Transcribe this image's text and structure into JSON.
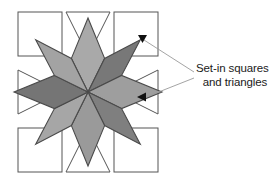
{
  "figure": {
    "title": "Set-in squares and triangles",
    "background_color": "#ffffff",
    "width": 275,
    "height": 185
  },
  "callout": {
    "line1": "Set-in squares",
    "line2": "and triangles",
    "text_color": "#1a1a1a",
    "leader_color": "#9a9a9a",
    "arrow_color": "#111111",
    "arrow_targets": [
      "top-right-set-in-square",
      "right-set-in-triangle"
    ]
  },
  "block": {
    "name": "eight-point-star-quilt-block",
    "outline_color": "#444444",
    "center": {
      "x": 88,
      "y": 92
    },
    "star": {
      "type": "lemoyne-eight-point-star",
      "point_count": 8,
      "outer_radius": 74,
      "half_width": 30.6,
      "edge_color": "#4a4a4a",
      "edge_width": 1.1,
      "diamonds": [
        {
          "name": "star-diamond-n",
          "direction": "north",
          "angle_deg": -90,
          "fill": "#a9a9a9"
        },
        {
          "name": "star-diamond-ne",
          "direction": "northeast",
          "angle_deg": -45,
          "fill": "#787878"
        },
        {
          "name": "star-diamond-e",
          "direction": "east",
          "angle_deg": 0,
          "fill": "#9e9e9e"
        },
        {
          "name": "star-diamond-se",
          "direction": "southeast",
          "angle_deg": 45,
          "fill": "#7f7f7f"
        },
        {
          "name": "star-diamond-s",
          "direction": "south",
          "angle_deg": 90,
          "fill": "#9a9a9a"
        },
        {
          "name": "star-diamond-sw",
          "direction": "southwest",
          "angle_deg": 135,
          "fill": "#a6a6a6"
        },
        {
          "name": "star-diamond-w",
          "direction": "west",
          "angle_deg": 180,
          "fill": "#757575"
        },
        {
          "name": "star-diamond-nw",
          "direction": "northwest",
          "angle_deg": -135,
          "fill": "#a3a3a3"
        }
      ]
    },
    "set_in_squares": {
      "count": 4,
      "fill": "#ffffff",
      "stroke": "#555555",
      "stroke_width": 1,
      "size": 44,
      "positions": [
        {
          "name": "set-in-square-top-left",
          "x": 18,
          "y": 12
        },
        {
          "name": "set-in-square-top-right",
          "x": 114,
          "y": 12
        },
        {
          "name": "set-in-square-bottom-left",
          "x": 18,
          "y": 128
        },
        {
          "name": "set-in-square-bottom-right",
          "x": 114,
          "y": 128
        }
      ]
    },
    "set_in_triangles": {
      "count": 4,
      "fill": "#ffffff",
      "stroke": "#555555",
      "stroke_width": 1,
      "positions": [
        {
          "name": "set-in-triangle-top",
          "orientation": "points-down"
        },
        {
          "name": "set-in-triangle-right",
          "orientation": "points-left"
        },
        {
          "name": "set-in-triangle-bottom",
          "orientation": "points-up"
        },
        {
          "name": "set-in-triangle-left",
          "orientation": "points-right"
        }
      ]
    }
  }
}
